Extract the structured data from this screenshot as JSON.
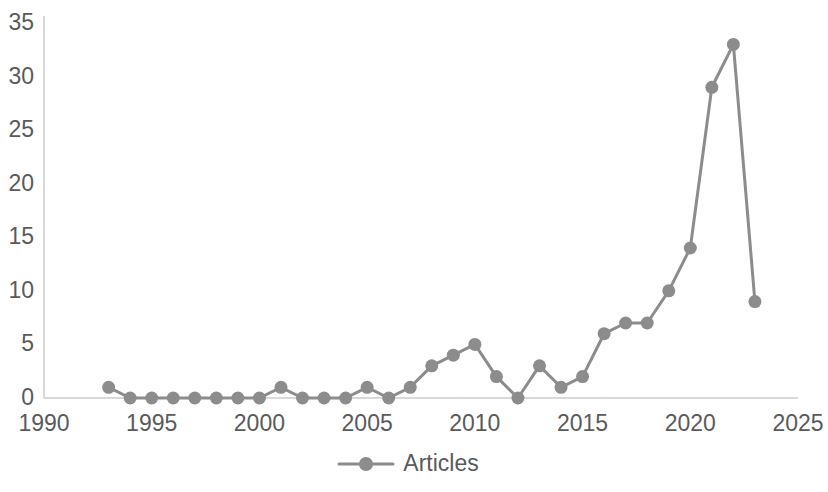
{
  "chart_data": {
    "type": "line",
    "title": "",
    "subtitle": "",
    "xlabel": "",
    "ylabel": "",
    "xlim": [
      1990,
      2025
    ],
    "ylim": [
      0,
      35
    ],
    "grid": false,
    "legend_position": "bottom",
    "legend": [
      "Articles"
    ],
    "xticks": [
      "1990",
      "1995",
      "2000",
      "2005",
      "2010",
      "2015",
      "2020",
      "2025"
    ],
    "xtick_values": [
      1990,
      1995,
      2000,
      2005,
      2010,
      2015,
      2020,
      2025
    ],
    "yticks": [
      "0",
      "5",
      "10",
      "15",
      "20",
      "25",
      "30",
      "35"
    ],
    "ytick_values": [
      0,
      5,
      10,
      15,
      20,
      25,
      30,
      35
    ],
    "x": [
      1993,
      1994,
      1995,
      1996,
      1997,
      1998,
      1999,
      2000,
      2001,
      2002,
      2003,
      2004,
      2005,
      2006,
      2007,
      2008,
      2009,
      2010,
      2011,
      2012,
      2013,
      2014,
      2015,
      2016,
      2017,
      2018,
      2019,
      2020,
      2021,
      2022,
      2023
    ],
    "series": [
      {
        "name": "Articles",
        "marker": "circle",
        "color": "#8c8c8c",
        "values": [
          1,
          0,
          0,
          0,
          0,
          0,
          0,
          0,
          1,
          0,
          0,
          0,
          1,
          0,
          1,
          3,
          4,
          5,
          2,
          0,
          3,
          1,
          2,
          6,
          7,
          7,
          10,
          14,
          29,
          33,
          9
        ]
      }
    ]
  },
  "legend": {
    "articles_label": "Articles"
  },
  "style": {
    "series_color": "#8c8c8c",
    "axis_color": "#d9d9d9",
    "text_color": "#5a5a5a",
    "background": "#ffffff"
  }
}
